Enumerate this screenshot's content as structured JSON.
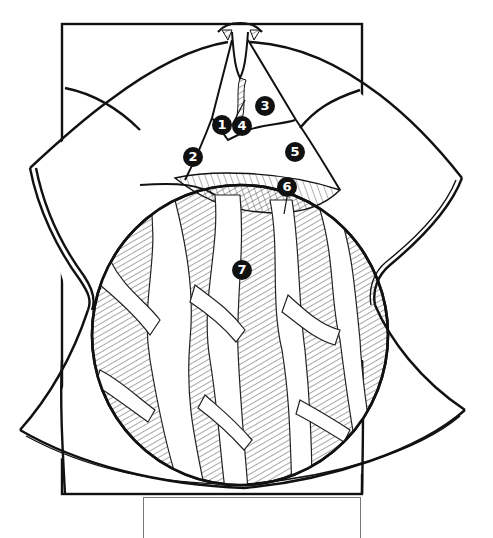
{
  "diagram": {
    "callouts": [
      {
        "id": "1",
        "label": "1",
        "x": 222,
        "y": 115
      },
      {
        "id": "2",
        "label": "2",
        "x": 183,
        "y": 157
      },
      {
        "id": "3",
        "label": "3",
        "x": 255,
        "y": 104
      },
      {
        "id": "4",
        "label": "4",
        "x": 237,
        "y": 125
      },
      {
        "id": "5",
        "label": "5",
        "x": 288,
        "y": 153
      },
      {
        "id": "6",
        "label": "6",
        "x": 277,
        "y": 187
      },
      {
        "id": "7",
        "label": "7",
        "x": 232,
        "y": 261
      }
    ],
    "label_box": {
      "text": ""
    },
    "colors": {
      "ink": "#111111",
      "paper": "#ffffff",
      "box_border": "#777777"
    }
  }
}
